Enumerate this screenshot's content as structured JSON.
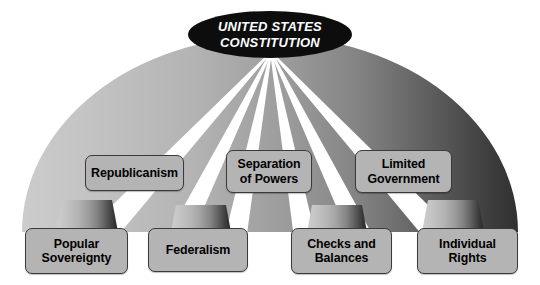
{
  "diagram": {
    "type": "dome-concept-map",
    "title": "UNITED STATES\nCONSTITUTION",
    "colors": {
      "crown_fill": "#0d0d0d",
      "crown_text": "#ffffff",
      "box_fill": "#b4b4b4",
      "box_border": "#3a3a3a",
      "box_text": "#000000",
      "rib_gradient_light": "#c9c9c9",
      "rib_gradient_dark": "#2b2b2b",
      "background": "#ffffff"
    },
    "middle_row": [
      {
        "id": "republicanism",
        "label": "Republicanism"
      },
      {
        "id": "separation-of-powers",
        "label": "Separation\nof Powers"
      },
      {
        "id": "limited-government",
        "label": "Limited\nGovernment"
      }
    ],
    "bottom_row": [
      {
        "id": "popular-sovereignty",
        "label": "Popular\nSovereignty"
      },
      {
        "id": "federalism",
        "label": "Federalism"
      },
      {
        "id": "checks-and-balances",
        "label": "Checks and\nBalances"
      },
      {
        "id": "individual-rights",
        "label": "Individual\nRights"
      }
    ]
  }
}
